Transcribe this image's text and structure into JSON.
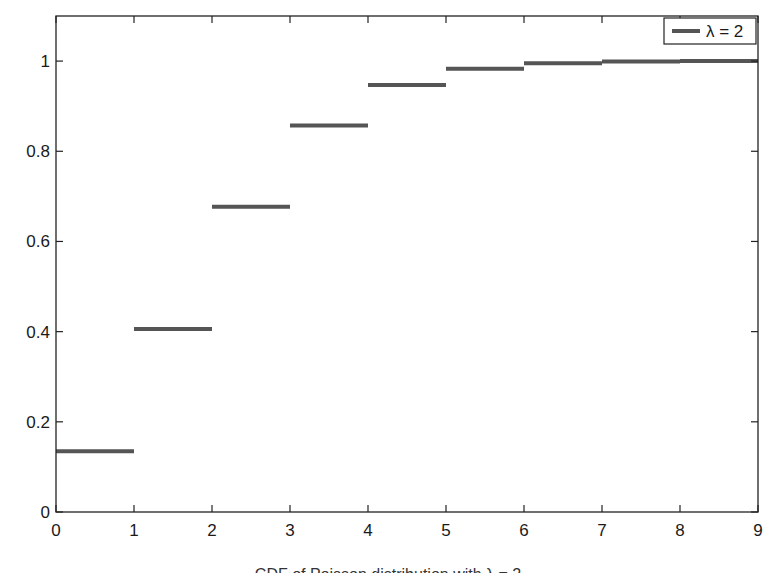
{
  "chart_data": {
    "type": "step",
    "title": "",
    "xlabel": "",
    "ylabel": "",
    "xlim": [
      0,
      9
    ],
    "ylim": [
      0,
      1.1
    ],
    "grid": false,
    "legend_position": "top-right",
    "x_ticks": [
      0,
      1,
      2,
      3,
      4,
      5,
      6,
      7,
      8,
      9
    ],
    "x_tick_labels": [
      "0",
      "1",
      "2",
      "3",
      "4",
      "5",
      "6",
      "7",
      "8",
      "9"
    ],
    "y_ticks": [
      0,
      0.2,
      0.4,
      0.6,
      0.8,
      1
    ],
    "y_tick_labels": [
      "0",
      "0.2",
      "0.4",
      "0.6",
      "0.8",
      "1"
    ],
    "series": [
      {
        "name": "λ = 2",
        "color": "#555555",
        "segments": [
          {
            "x0": 0,
            "x1": 1,
            "y": 0.135
          },
          {
            "x0": 1,
            "x1": 2,
            "y": 0.406
          },
          {
            "x0": 2,
            "x1": 3,
            "y": 0.677
          },
          {
            "x0": 3,
            "x1": 4,
            "y": 0.857
          },
          {
            "x0": 4,
            "x1": 5,
            "y": 0.947
          },
          {
            "x0": 5,
            "x1": 6,
            "y": 0.983
          },
          {
            "x0": 6,
            "x1": 7,
            "y": 0.995
          },
          {
            "x0": 7,
            "x1": 8,
            "y": 0.999
          },
          {
            "x0": 8,
            "x1": 9,
            "y": 1.0
          }
        ]
      }
    ]
  },
  "legend": {
    "label": "λ = 2"
  },
  "caption": "CDF of Poisson distribution with λ = 2"
}
